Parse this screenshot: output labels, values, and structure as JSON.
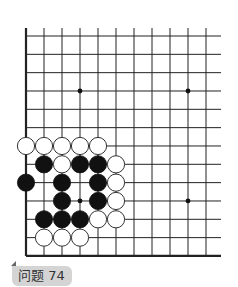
{
  "problem": {
    "label": "问题 74"
  },
  "board": {
    "origin_x": 26,
    "origin_y": 36,
    "spacing_x": 18,
    "spacing_y": 18.33,
    "columns": 11,
    "rows": 13,
    "line_extend_right": 15,
    "line_extend_top": 8,
    "left_edge": true,
    "bottom_edge": true,
    "line_color": "#222222",
    "star_points": [
      [
        3,
        3
      ],
      [
        9,
        3
      ],
      [
        3,
        9
      ],
      [
        9,
        9
      ]
    ],
    "stones": [
      {
        "color": "white",
        "col": 0,
        "row": 6
      },
      {
        "color": "white",
        "col": 1,
        "row": 6
      },
      {
        "color": "white",
        "col": 2,
        "row": 6
      },
      {
        "color": "white",
        "col": 3,
        "row": 6
      },
      {
        "color": "white",
        "col": 4,
        "row": 6
      },
      {
        "color": "black",
        "col": 1,
        "row": 7
      },
      {
        "color": "white",
        "col": 2,
        "row": 7
      },
      {
        "color": "black",
        "col": 3,
        "row": 7
      },
      {
        "color": "black",
        "col": 4,
        "row": 7
      },
      {
        "color": "white",
        "col": 5,
        "row": 7
      },
      {
        "color": "black",
        "col": 0,
        "row": 8
      },
      {
        "color": "black",
        "col": 2,
        "row": 8
      },
      {
        "color": "black",
        "col": 4,
        "row": 8
      },
      {
        "color": "white",
        "col": 5,
        "row": 8
      },
      {
        "color": "black",
        "col": 2,
        "row": 9
      },
      {
        "color": "black",
        "col": 4,
        "row": 9
      },
      {
        "color": "white",
        "col": 5,
        "row": 9
      },
      {
        "color": "black",
        "col": 1,
        "row": 10
      },
      {
        "color": "black",
        "col": 2,
        "row": 10
      },
      {
        "color": "black",
        "col": 3,
        "row": 10
      },
      {
        "color": "white",
        "col": 4,
        "row": 10
      },
      {
        "color": "white",
        "col": 5,
        "row": 10
      },
      {
        "color": "white",
        "col": 1,
        "row": 11
      },
      {
        "color": "white",
        "col": 2,
        "row": 11
      },
      {
        "color": "white",
        "col": 3,
        "row": 11
      }
    ]
  }
}
